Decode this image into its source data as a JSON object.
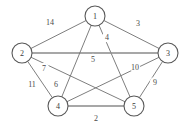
{
  "figure": {
    "background_color": "#ffffff",
    "edge_color": "#6f6f6f",
    "node_stroke_color": "#585858",
    "node_fill_color": "#ffffff",
    "label_color": "#4a4a4a"
  },
  "chart_data": {
    "type": "diagram",
    "diagram_kind": "weighted-undirected-graph",
    "title": "",
    "nodes": [
      {
        "id": "1",
        "label": "1",
        "x": 95,
        "y": 16,
        "r": 10
      },
      {
        "id": "2",
        "label": "2",
        "x": 22,
        "y": 53,
        "r": 10
      },
      {
        "id": "3",
        "label": "3",
        "x": 168,
        "y": 53,
        "r": 10
      },
      {
        "id": "4",
        "label": "4",
        "x": 58,
        "y": 106,
        "r": 10
      },
      {
        "id": "5",
        "label": "5",
        "x": 134,
        "y": 106,
        "r": 10
      }
    ],
    "edges": [
      {
        "from": "1",
        "to": "2",
        "weight": "14",
        "lx": 50,
        "ly": 22,
        "thick": false
      },
      {
        "from": "1",
        "to": "3",
        "weight": "3",
        "lx": 138,
        "ly": 23,
        "thick": false
      },
      {
        "from": "1",
        "to": "5",
        "weight": "4",
        "lx": 107,
        "ly": 37,
        "thick": false
      },
      {
        "from": "2",
        "to": "3",
        "weight": "5",
        "lx": 93,
        "ly": 59,
        "thick": true
      },
      {
        "from": "2",
        "to": "5",
        "weight": "7",
        "lx": 44,
        "ly": 68,
        "thick": false
      },
      {
        "from": "2",
        "to": "4",
        "weight": "11",
        "lx": 32,
        "ly": 84,
        "thick": false
      },
      {
        "from": "1",
        "to": "4",
        "weight": "6",
        "lx": 56,
        "ly": 84,
        "thick": false
      },
      {
        "from": "3",
        "to": "4",
        "weight": "10",
        "lx": 135,
        "ly": 67,
        "thick": false
      },
      {
        "from": "3",
        "to": "5",
        "weight": "9",
        "lx": 155,
        "ly": 82,
        "thick": false
      },
      {
        "from": "4",
        "to": "5",
        "weight": "2",
        "lx": 96,
        "ly": 118,
        "thick": true
      }
    ],
    "node_count": 5,
    "edge_count": 10
  }
}
